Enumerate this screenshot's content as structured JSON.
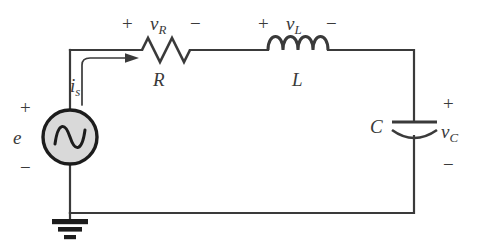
{
  "figure": {
    "type": "circuit-schematic",
    "background_color": "#ffffff",
    "wire_color": "#3a3a3a",
    "source_fill_color": "#d9d9d9",
    "label_color": "#3a3a3a"
  },
  "source": {
    "name": "voltage-source",
    "symbol": "sine-wave",
    "label": "e",
    "plus": "+",
    "minus": "−"
  },
  "ground": {
    "name": "ground",
    "symbol": "earth-ground"
  },
  "current": {
    "label_base": "i",
    "label_sub": "s",
    "arrow": "right-arrow"
  },
  "resistor": {
    "component_label": "R",
    "voltage_base": "v",
    "voltage_sub": "R",
    "plus": "+",
    "minus": "−",
    "zigzag_peaks": 3
  },
  "inductor": {
    "component_label": "L",
    "voltage_base": "v",
    "voltage_sub": "L",
    "plus": "+",
    "minus": "−",
    "coils": 4
  },
  "capacitor": {
    "component_label": "C",
    "voltage_base": "v",
    "voltage_sub": "C",
    "plus": "+",
    "minus": "−",
    "plate_style": "curved-bottom-plate"
  }
}
